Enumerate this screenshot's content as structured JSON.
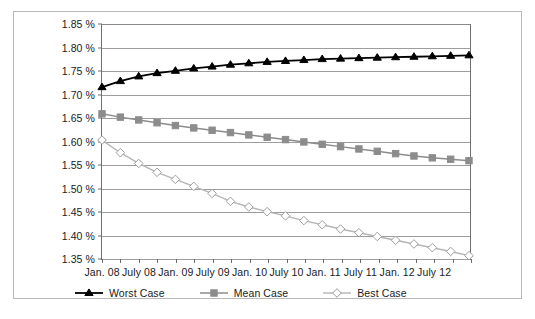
{
  "chart_data": {
    "type": "line",
    "title": "",
    "subtitle": "",
    "xlabel": "",
    "ylabel": "",
    "grid": true,
    "legend_position": "bottom-left",
    "ylim": [
      1.35,
      1.85
    ],
    "ytick_values": [
      1.35,
      1.4,
      1.45,
      1.5,
      1.55,
      1.6,
      1.65,
      1.7,
      1.75,
      1.8,
      1.85
    ],
    "ytick_labels": [
      "1.35 %",
      "1.40 %",
      "1.45 %",
      "1.50 %",
      "1.55 %",
      "1.60 %",
      "1.65 %",
      "1.70 %",
      "1.75 %",
      "1.80 %",
      "1.85 %"
    ],
    "x": [
      "Jan. 08",
      "Apr. 08",
      "July 08",
      "Oct. 08",
      "Jan. 09",
      "Apr. 09",
      "July 09",
      "Oct. 09",
      "Jan. 10",
      "Apr. 10",
      "July 10",
      "Oct. 10",
      "Jan. 11",
      "Apr. 11",
      "July 11",
      "Oct. 11",
      "Jan. 12",
      "Apr. 12",
      "July 12",
      "Oct. 12",
      "Jan. 13"
    ],
    "xtick_labels": [
      "Jan. 08",
      "July 08",
      "Jan. 09",
      "July 09",
      "Jan. 10",
      "July 10",
      "Jan. 11",
      "July 11",
      "Jan. 12",
      "July 12"
    ],
    "xtick_label_indices": [
      0,
      2,
      4,
      6,
      8,
      10,
      12,
      14,
      16,
      18
    ],
    "n_xticks": 21,
    "series": [
      {
        "name": "Worst Case",
        "color": "#000000",
        "marker": "triangle",
        "marker_fill": "#000000",
        "line_width": 1.8,
        "values": [
          1.715,
          1.728,
          1.738,
          1.745,
          1.75,
          1.755,
          1.759,
          1.763,
          1.766,
          1.769,
          1.771,
          1.773,
          1.775,
          1.776,
          1.777,
          1.778,
          1.779,
          1.78,
          1.781,
          1.782,
          1.783
        ]
      },
      {
        "name": "Mean Case",
        "color": "#8c8c8c",
        "marker": "square",
        "marker_fill": "#8c8c8c",
        "line_width": 1.5,
        "values": [
          1.658,
          1.651,
          1.645,
          1.639,
          1.633,
          1.628,
          1.623,
          1.618,
          1.613,
          1.608,
          1.603,
          1.598,
          1.593,
          1.588,
          1.583,
          1.578,
          1.573,
          1.568,
          1.564,
          1.561,
          1.558
        ]
      },
      {
        "name": "Best Case",
        "color": "#b5b5b5",
        "marker": "diamond",
        "marker_fill": "#ffffff",
        "line_width": 1.4,
        "values": [
          1.602,
          1.575,
          1.552,
          1.533,
          1.518,
          1.503,
          1.488,
          1.471,
          1.459,
          1.449,
          1.44,
          1.43,
          1.421,
          1.412,
          1.404,
          1.396,
          1.388,
          1.38,
          1.372,
          1.364,
          1.355
        ]
      }
    ]
  },
  "legend": {
    "items": [
      {
        "label": "Worst Case"
      },
      {
        "label": "Mean Case"
      },
      {
        "label": "Best Case"
      }
    ]
  }
}
